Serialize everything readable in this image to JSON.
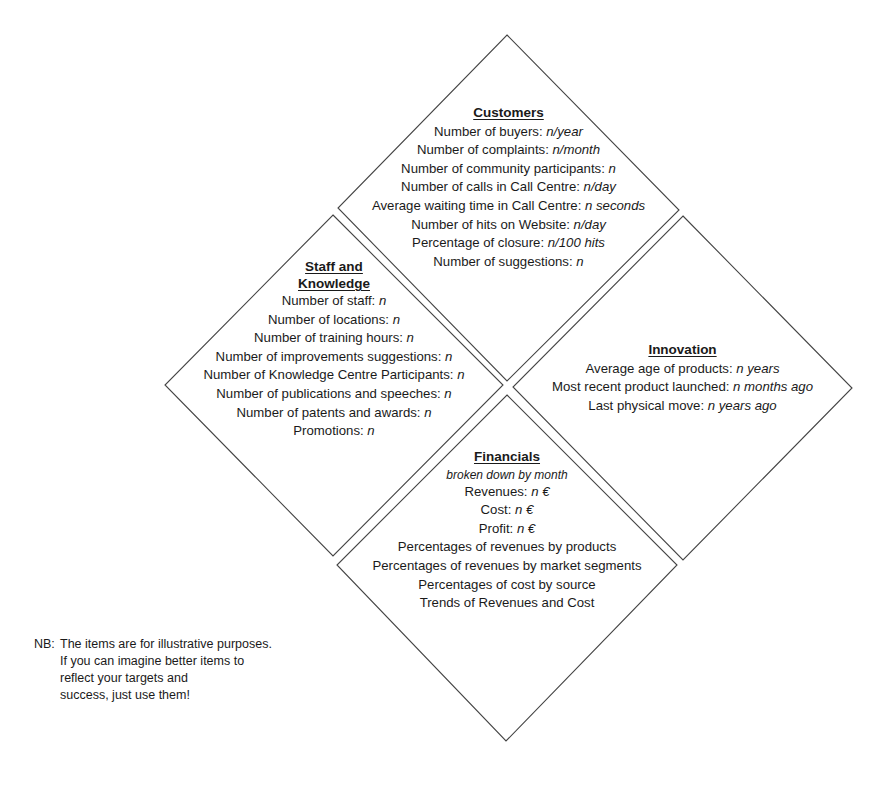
{
  "quadrants": {
    "customers": {
      "title": "Customers",
      "items": [
        {
          "label": "Number of buyers: ",
          "value": "n/year"
        },
        {
          "label": "Number of complaints: ",
          "value": "n/month"
        },
        {
          "label": "Number of community participants: ",
          "value": "n"
        },
        {
          "label": "Number of calls in Call Centre: ",
          "value": "n/day"
        },
        {
          "label": "Average waiting time in Call Centre: ",
          "value": "n seconds"
        },
        {
          "label": "Number of hits on Website: ",
          "value": "n/day"
        },
        {
          "label": "Percentage of closure: ",
          "value": "n/100 hits"
        },
        {
          "label": "Number of suggestions: ",
          "value": "n"
        }
      ]
    },
    "staff": {
      "title_line1": "Staff and",
      "title_line2": "Knowledge",
      "items": [
        {
          "label": "Number of staff: ",
          "value": "n"
        },
        {
          "label": "Number of locations: ",
          "value": "n"
        },
        {
          "label": "Number of training hours: ",
          "value": "n"
        },
        {
          "label": "Number of improvements suggestions: ",
          "value": "n"
        },
        {
          "label": "Number of Knowledge Centre Participants: ",
          "value": "n"
        },
        {
          "label": "Number of publications and speeches: ",
          "value": "n"
        },
        {
          "label": "Number of patents and awards: ",
          "value": "n"
        },
        {
          "label": "Promotions: ",
          "value": "n"
        }
      ]
    },
    "innovation": {
      "title": "Innovation",
      "items": [
        {
          "label": "Average age of products: ",
          "value": "n years"
        },
        {
          "label": "Most recent product launched: ",
          "value": "n months ago"
        },
        {
          "label": "Last physical move: ",
          "value": "n years ago"
        }
      ]
    },
    "financials": {
      "title": "Financials",
      "subtitle": "broken down by month",
      "items": [
        {
          "label": "Revenues: ",
          "value": "n €"
        },
        {
          "label": "Cost: ",
          "value": "n €"
        },
        {
          "label": "Profit: ",
          "value": "n €"
        },
        {
          "label": "Percentages of revenues by products",
          "value": ""
        },
        {
          "label": "Percentages of revenues by market segments",
          "value": ""
        },
        {
          "label": "Percentages of cost by source",
          "value": ""
        },
        {
          "label": "Trends of Revenues and Cost",
          "value": ""
        }
      ]
    }
  },
  "note": {
    "prefix": "NB:",
    "lines": [
      "The items are for illustrative purposes.",
      "If you can imagine better items to",
      "reflect your targets and",
      "success, just use them!"
    ]
  },
  "colors": {
    "line": "#444444",
    "text": "#1a1a1a",
    "background": "#ffffff"
  }
}
